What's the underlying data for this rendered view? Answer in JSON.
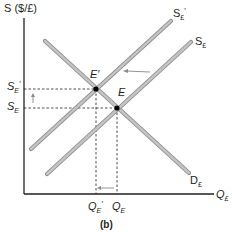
{
  "diagram": {
    "y_axis_label": "S ($/£)",
    "x_axis_label": "Q",
    "x_axis_label_sub": "£",
    "caption": "(b)",
    "curves": {
      "supply_original": {
        "label": "S",
        "sub": "£"
      },
      "supply_shifted": {
        "label": "S",
        "sub": "£",
        "prime": "′"
      },
      "demand": {
        "label": "D",
        "sub": "£"
      }
    },
    "points": {
      "e_original": {
        "label": "E"
      },
      "e_shifted": {
        "label": "E′"
      }
    },
    "y_ticks": {
      "se_prime": {
        "label": "S",
        "sub": "E",
        "prime": "′"
      },
      "se": {
        "label": "S",
        "sub": "E"
      }
    },
    "x_ticks": {
      "qe_prime": {
        "label": "Q",
        "sub": "E",
        "prime": "′"
      },
      "qe": {
        "label": "Q",
        "sub": "E"
      }
    },
    "colors": {
      "axis": "#231f20",
      "curve": "#b3b3b3",
      "curve_edge": "#8c8c8c",
      "arrow": "#888888",
      "point": "#000000"
    }
  }
}
